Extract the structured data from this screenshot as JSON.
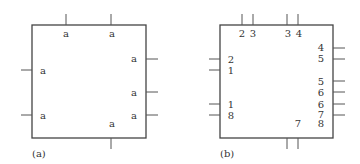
{
  "panels": [
    {
      "caption": "(a)",
      "box": {
        "x": 32,
        "y": 25,
        "w": 114,
        "h": 113
      },
      "stubs": [
        {
          "side": "top",
          "pos": 66
        },
        {
          "side": "top",
          "pos": 111
        },
        {
          "side": "left",
          "pos": 70
        },
        {
          "side": "left",
          "pos": 115
        },
        {
          "side": "right",
          "pos": 59
        },
        {
          "side": "right",
          "pos": 92
        },
        {
          "side": "right",
          "pos": 115
        },
        {
          "side": "bottom",
          "pos": 111
        }
      ],
      "labels": [
        {
          "text": "a",
          "x": 66,
          "y": 37
        },
        {
          "text": "a",
          "x": 112,
          "y": 37
        },
        {
          "text": "a",
          "x": 43,
          "y": 74
        },
        {
          "text": "a",
          "x": 43,
          "y": 119
        },
        {
          "text": "a",
          "x": 134,
          "y": 62
        },
        {
          "text": "a",
          "x": 134,
          "y": 96
        },
        {
          "text": "a",
          "x": 134,
          "y": 119
        },
        {
          "text": "a",
          "x": 112,
          "y": 127
        }
      ]
    },
    {
      "caption": "(b)",
      "box": {
        "x": 220,
        "y": 25,
        "w": 113,
        "h": 113
      },
      "stubs": [
        {
          "side": "top",
          "pos": 242
        },
        {
          "side": "top",
          "pos": 253
        },
        {
          "side": "top",
          "pos": 287
        },
        {
          "side": "top",
          "pos": 298
        },
        {
          "side": "left",
          "pos": 59
        },
        {
          "side": "left",
          "pos": 70
        },
        {
          "side": "left",
          "pos": 104
        },
        {
          "side": "left",
          "pos": 115
        },
        {
          "side": "right",
          "pos": 48
        },
        {
          "side": "right",
          "pos": 59
        },
        {
          "side": "right",
          "pos": 81
        },
        {
          "side": "right",
          "pos": 92
        },
        {
          "side": "right",
          "pos": 104
        },
        {
          "side": "right",
          "pos": 115
        },
        {
          "side": "bottom",
          "pos": 287
        },
        {
          "side": "bottom",
          "pos": 298
        }
      ],
      "labels": [
        {
          "text": "2",
          "x": 242,
          "y": 37
        },
        {
          "text": "3",
          "x": 253,
          "y": 37
        },
        {
          "text": "3",
          "x": 288,
          "y": 37
        },
        {
          "text": "4",
          "x": 299,
          "y": 37
        },
        {
          "text": "2",
          "x": 231,
          "y": 63
        },
        {
          "text": "1",
          "x": 231,
          "y": 74
        },
        {
          "text": "1",
          "x": 231,
          "y": 108
        },
        {
          "text": "8",
          "x": 231,
          "y": 119
        },
        {
          "text": "4",
          "x": 321,
          "y": 51
        },
        {
          "text": "5",
          "x": 321,
          "y": 62
        },
        {
          "text": "5",
          "x": 321,
          "y": 85
        },
        {
          "text": "6",
          "x": 321,
          "y": 96
        },
        {
          "text": "6",
          "x": 321,
          "y": 108
        },
        {
          "text": "7",
          "x": 321,
          "y": 118
        },
        {
          "text": "8",
          "x": 321,
          "y": 127
        },
        {
          "text": "7",
          "x": 298,
          "y": 127
        }
      ]
    }
  ]
}
